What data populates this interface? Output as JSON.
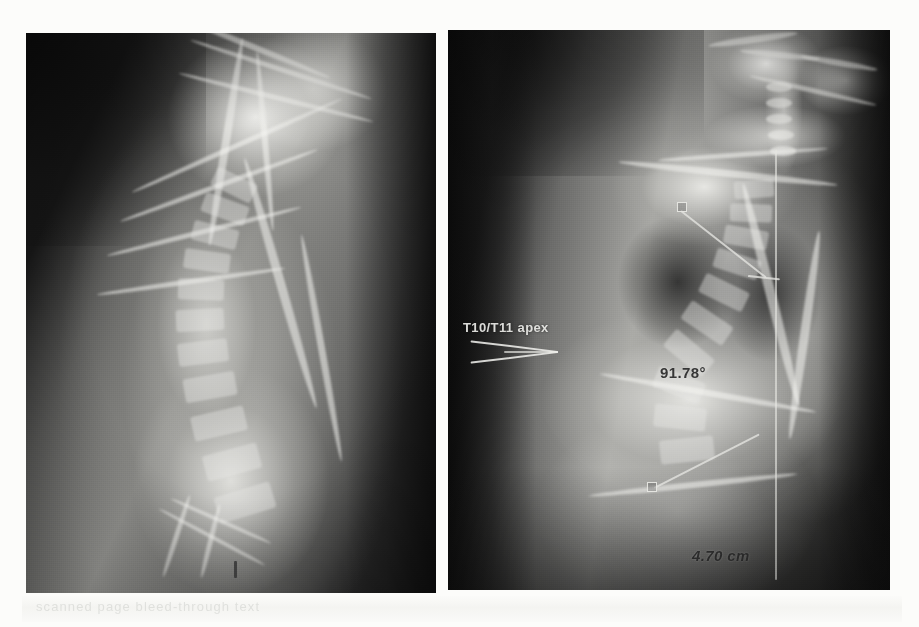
{
  "document": {
    "title": "Lateral spine radiograph pair with kyphosis measurements",
    "background_color": "#fdfdfb",
    "ghost_caption": "scanned page bleed-through text"
  },
  "panels": [
    {
      "id": "left",
      "name": "lateral-thoracic-radiograph",
      "caption": "",
      "modality": "X-ray",
      "view": "lateral",
      "region": "thoracolumbar spine",
      "annotations": []
    },
    {
      "id": "right",
      "name": "lateral-full-spine-radiograph",
      "caption": "",
      "modality": "X-ray",
      "view": "lateral",
      "region": "cervical to pelvis",
      "annotations": [
        {
          "name": "apex-label",
          "text": "T10/T11 apex",
          "type": "text-label",
          "color": "#e8e8e4"
        },
        {
          "name": "kyphosis-angle",
          "text": "91.78°",
          "value": 91.78,
          "unit": "degrees",
          "type": "angle-measurement",
          "color": "#282828"
        },
        {
          "name": "sagittal-balance-distance",
          "text": "4.70 cm",
          "value": 4.7,
          "unit": "cm",
          "type": "distance-measurement",
          "color": "#282828"
        }
      ]
    }
  ],
  "overlay": {
    "arrow_name": "apex-pointer-arrow",
    "plumb_name": "vertical-plumb-line",
    "handle_name": "measurement-handle"
  }
}
